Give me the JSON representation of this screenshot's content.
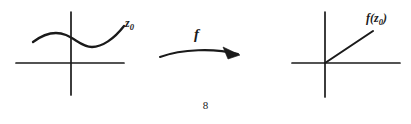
{
  "page": {
    "background_color": "#ffffff",
    "ink_color": "#1a1a1a",
    "page_number": "8"
  },
  "figure": {
    "caption_labels": {
      "source_point": "z",
      "source_point_subscript": "0",
      "map": "f",
      "image_point_prefix": "f(z",
      "image_point_subscript": "0",
      "image_point_suffix": ")"
    },
    "left_diagram": {
      "name": "source-plane",
      "x_axis": {
        "from_x": 16,
        "to_x": 124,
        "y": 63
      },
      "y_axis": {
        "x": 71,
        "from_y": 12,
        "to_y": 95
      },
      "curve_path": "M 33 42 C 45 33, 56 31, 66 35 C 76 39, 82 47, 92 47 C 102 47, 114 39, 124 26",
      "label_text": "z",
      "label_subscript": "0"
    },
    "arrow": {
      "name": "map-arrow",
      "shaft_path": "M 160 57 C 182 49, 214 48, 238 54",
      "head_points": "238,54 224,48 229,58",
      "label": "f"
    },
    "right_diagram": {
      "name": "image-plane",
      "x_axis": {
        "from_x": 292,
        "to_x": 400,
        "y": 63
      },
      "y_axis": {
        "x": 325,
        "from_y": 12,
        "to_y": 97
      },
      "ray_path": "M 325 63 L 373 31",
      "label_text": "f(z",
      "label_subscript": "0",
      "label_suffix": ")"
    }
  }
}
